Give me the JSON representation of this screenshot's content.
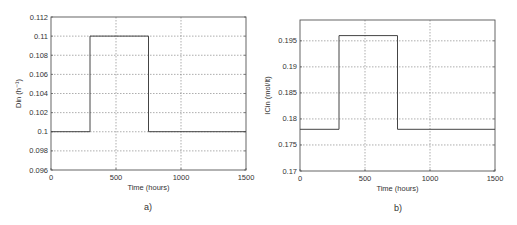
{
  "chart_data": [
    {
      "type": "line",
      "caption": "a)",
      "title": "",
      "xlabel": "Time (hours)",
      "ylabel": "Din (h⁻¹)",
      "xlim": [
        0,
        1500
      ],
      "ylim": [
        0.096,
        0.112
      ],
      "xticks": [
        0,
        500,
        1000,
        1500
      ],
      "xtick_labels": [
        "0",
        "500",
        "1000",
        "1500"
      ],
      "yticks": [
        0.096,
        0.098,
        0.1,
        0.102,
        0.104,
        0.106,
        0.108,
        0.11,
        0.112
      ],
      "ytick_labels": [
        "0.096",
        "0.098",
        "0.1",
        "0.102",
        "0.104",
        "0.106",
        "0.108",
        "0.11",
        "0.112"
      ],
      "grid": true,
      "series": [
        {
          "name": "Din",
          "x": [
            0,
            300,
            300,
            750,
            750,
            1500
          ],
          "y": [
            0.1,
            0.1,
            0.11,
            0.11,
            0.1,
            0.1
          ]
        }
      ]
    },
    {
      "type": "line",
      "caption": "b)",
      "title": "",
      "xlabel": "Time (hours)",
      "ylabel": "ICin (mol/lt)",
      "xlim": [
        0,
        1500
      ],
      "ylim": [
        0.17,
        0.199
      ],
      "xticks": [
        0,
        500,
        1000,
        1500
      ],
      "xtick_labels": [
        "0",
        "500",
        "1000",
        "1500"
      ],
      "yticks": [
        0.17,
        0.175,
        0.18,
        0.185,
        0.19,
        0.195
      ],
      "ytick_labels": [
        "0.17",
        "0.175",
        "0.18",
        "0.185",
        "0.19",
        "0.195"
      ],
      "grid": true,
      "series": [
        {
          "name": "ICin",
          "x": [
            0,
            300,
            300,
            750,
            750,
            1500
          ],
          "y": [
            0.178,
            0.178,
            0.196,
            0.196,
            0.178,
            0.178
          ]
        }
      ]
    }
  ]
}
